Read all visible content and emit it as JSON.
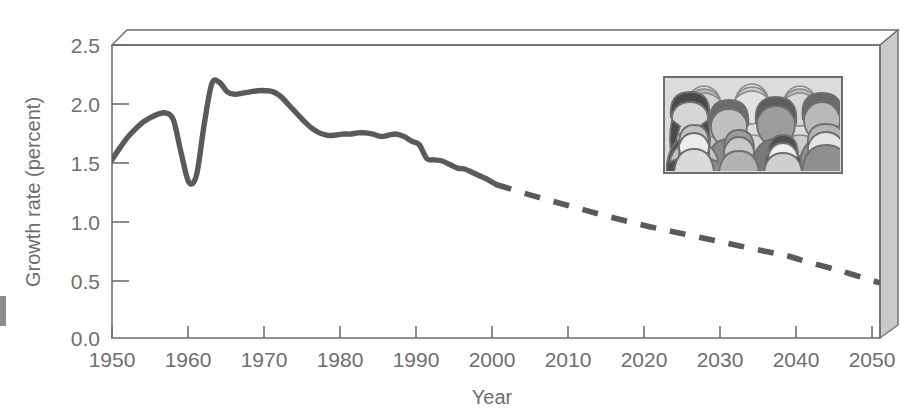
{
  "figure": {
    "background_color": "#ffffff",
    "line_color": "#5a5a5a",
    "axis_color": "#6e6e6e",
    "box_face_color": "#cccccc",
    "box_top_color": "#ffffff"
  },
  "axes": {
    "y_title": "Growth rate (percent)",
    "x_title": "Year",
    "y_ticks": [
      "0.0",
      "0.5",
      "1.0",
      "1.5",
      "2.0",
      "2.5"
    ],
    "x_ticks": [
      "1950",
      "1960",
      "1970",
      "1980",
      "1990",
      "2000",
      "2010",
      "2020",
      "2030",
      "2040",
      "2050"
    ]
  },
  "inset": {
    "name": "crowd-of-people-illustration",
    "frame_color": "#6e6e6e",
    "background_color": "#d8d8d8"
  },
  "chart_data": {
    "type": "line",
    "title": "",
    "xlabel": "Year",
    "ylabel": "Growth rate (percent)",
    "xlim": [
      1950,
      2050
    ],
    "ylim": [
      0.0,
      2.5
    ],
    "xticks": [
      1950,
      1960,
      1970,
      1980,
      1990,
      2000,
      2010,
      2020,
      2030,
      2040,
      2050
    ],
    "yticks": [
      0.0,
      0.5,
      1.0,
      1.5,
      2.0,
      2.5
    ],
    "grid": false,
    "legend_position": "none",
    "series": [
      {
        "name": "Observed growth rate",
        "style": "solid",
        "color": "#5a5a5a",
        "x": [
          1950,
          1951,
          1952,
          1953,
          1954,
          1955,
          1956,
          1957,
          1958,
          1959,
          1960,
          1961,
          1962,
          1963,
          1964,
          1965,
          1966,
          1967,
          1968,
          1969,
          1970,
          1971,
          1972,
          1973,
          1974,
          1975,
          1976,
          1977,
          1978,
          1979,
          1980,
          1981,
          1982,
          1983,
          1984,
          1985,
          1986,
          1987,
          1988,
          1989,
          1990,
          1991,
          1992,
          1993,
          1994,
          1995,
          1996,
          1997,
          1998,
          1999,
          2000
        ],
        "y": [
          1.52,
          1.62,
          1.71,
          1.78,
          1.84,
          1.88,
          1.91,
          1.92,
          1.86,
          1.58,
          1.33,
          1.39,
          1.82,
          2.17,
          2.18,
          2.1,
          2.08,
          2.09,
          2.1,
          2.11,
          2.11,
          2.1,
          2.06,
          1.99,
          1.92,
          1.85,
          1.79,
          1.75,
          1.73,
          1.73,
          1.74,
          1.74,
          1.75,
          1.75,
          1.74,
          1.72,
          1.73,
          1.74,
          1.72,
          1.68,
          1.65,
          1.53,
          1.52,
          1.51,
          1.48,
          1.45,
          1.44,
          1.41,
          1.38,
          1.35,
          1.31
        ]
      },
      {
        "name": "Projected growth rate",
        "style": "dashed",
        "color": "#5a5a5a",
        "x": [
          2000,
          2005,
          2010,
          2015,
          2020,
          2025,
          2030,
          2035,
          2038,
          2040,
          2045,
          2050
        ],
        "y": [
          1.31,
          1.21,
          1.12,
          1.03,
          0.95,
          0.88,
          0.81,
          0.74,
          0.7,
          0.66,
          0.57,
          0.47
        ]
      }
    ],
    "annotations": [
      {
        "kind": "inset-image",
        "label": "crowd of people illustration",
        "x_range": [
          1990,
          2050
        ],
        "y_range": [
          1.4,
          2.22
        ]
      }
    ]
  }
}
